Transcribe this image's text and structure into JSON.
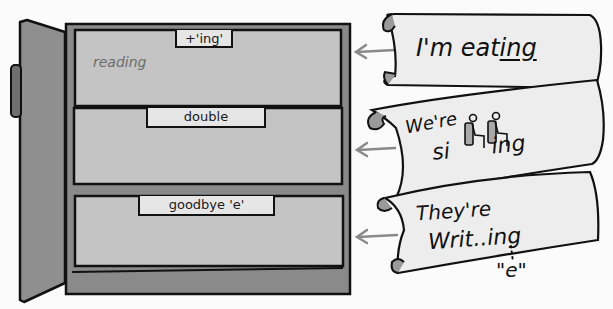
{
  "cabinet": {
    "drawers": [
      {
        "label": "+'ing'",
        "content": "reading"
      },
      {
        "label": "double",
        "content": ""
      },
      {
        "label": "goodbye 'e'",
        "content": ""
      }
    ],
    "colors": {
      "frame": "#8a8a8a",
      "drawer_face": "#c4c4c4",
      "door": "#8f8f8f",
      "label_bg": "#e6e6e6",
      "outline": "#111111"
    }
  },
  "scrolls": [
    {
      "line1": "I'm eat",
      "underlined": "ing",
      "line2": ""
    },
    {
      "line1": "We're",
      "line2_prefix": "si",
      "double_letter_icon": "two-seated-figures-icon",
      "line2_suffix": "ing"
    },
    {
      "line1": "They're",
      "line2": "Writ..ing",
      "dropped_letter": "\"e\""
    }
  ],
  "arrows": {
    "color": "#8a8a8a",
    "count": 3
  }
}
